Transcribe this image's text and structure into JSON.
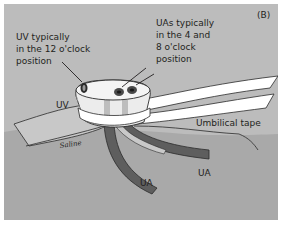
{
  "figure": {
    "panel_label": "(B)",
    "colors": {
      "background_upper": "#bcbcbc",
      "background_lower": "#a9a9a9",
      "tape": "#ffffff",
      "stump": "#ececec",
      "vessel_dark": "#5e5e5e",
      "vessel_light": "#c9c9c9",
      "outline": "#2b2b2b"
    }
  },
  "annotations": {
    "uv_callout": [
      "UV typically",
      "in the 12 o'clock",
      "position"
    ],
    "ua_callout": [
      "UAs typically",
      "in the 4 and",
      "8 o'clock",
      "position"
    ],
    "uv_label": "UV",
    "umbilical_tape_label": "Umbilical tape",
    "saline_label": "Saline",
    "ua_label_left": "UA",
    "ua_label_right": "UA"
  }
}
